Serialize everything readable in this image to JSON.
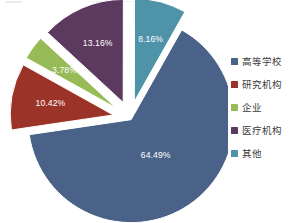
{
  "chart_data": {
    "type": "pie",
    "title": "",
    "subtitle": "",
    "xlabel": "",
    "ylabel": "",
    "grid": false,
    "legend_position": "right",
    "categories": [
      "高等学校",
      "研究机构",
      "企业",
      "医疗机构",
      "其他"
    ],
    "values": [
      64.49,
      10.42,
      3.78,
      13.16,
      8.16
    ],
    "value_unit": "%",
    "data_labels": [
      "64.49%",
      "10.42%",
      "3.78%",
      "13.16%",
      "8.16%"
    ],
    "colors": [
      "#4a6288",
      "#9c3328",
      "#96bb57",
      "#5c3a5f",
      "#4f93a9"
    ],
    "exploded": true,
    "slices": [
      {
        "label": "高等学校",
        "value": 64.49,
        "data_label": "64.49%",
        "color": "#4a6288",
        "start_angle": 29.4,
        "sweep": 232.2,
        "explode": 2
      },
      {
        "label": "研究机构",
        "value": 10.42,
        "data_label": "10.42%",
        "color": "#9c3328",
        "start_angle": 261.6,
        "sweep": 37.5,
        "explode": 17
      },
      {
        "label": "企业",
        "value": 3.78,
        "data_label": "3.78%",
        "color": "#96bb57",
        "start_angle": 299.1,
        "sweep": 13.6,
        "explode": 17
      },
      {
        "label": "医疗机构",
        "value": 13.16,
        "data_label": "13.16%",
        "color": "#5c3a5f",
        "start_angle": 312.7,
        "sweep": 47.4,
        "explode": 17
      },
      {
        "label": "其他",
        "value": 8.16,
        "data_label": "8.16%",
        "color": "#4f93a9",
        "start_angle": 0.1,
        "sweep": 29.3,
        "explode": 17
      }
    ]
  },
  "legend": {
    "items": [
      {
        "label": "高等学校",
        "color": "#4a6288"
      },
      {
        "label": "研究机构",
        "color": "#9c3328"
      },
      {
        "label": "企业",
        "color": "#96bb57"
      },
      {
        "label": "医疗机构",
        "color": "#5c3a5f"
      },
      {
        "label": "其他",
        "color": "#4f93a9"
      }
    ]
  }
}
